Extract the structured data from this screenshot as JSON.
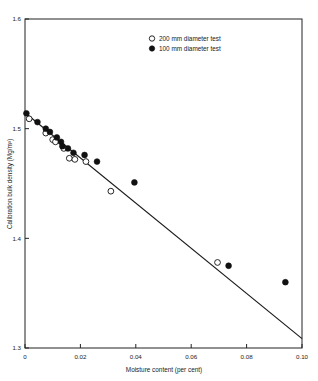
{
  "figure": {
    "caption_sliver": "",
    "background": "#ffffff",
    "ink_color": "#111111"
  },
  "legend": {
    "position": "top-center",
    "entries": [
      {
        "marker": "open-circle",
        "label": "200 mm diameter test"
      },
      {
        "marker": "filled-circle",
        "label": "100 mm diameter test"
      }
    ]
  },
  "axes": {
    "x": {
      "label": "Moisture content (per cent)",
      "ticks": [
        "0",
        "0.02",
        "0.04",
        "0.06",
        "0.08",
        "0.10"
      ],
      "tick_values": [
        0,
        0.02,
        0.04,
        0.06,
        0.08,
        0.1
      ],
      "min": 0,
      "max": 0.1
    },
    "y": {
      "label": "Calibration bulk density (Mg/m³)",
      "ticks": [
        "1.3",
        "1.4",
        "1.5",
        "1.6"
      ],
      "tick_values": [
        1.3,
        1.4,
        1.5,
        1.6
      ],
      "min": 1.3,
      "max": 1.6
    }
  },
  "chart_data": {
    "type": "scatter",
    "title": "",
    "xlabel": "Moisture content (per cent)",
    "ylabel": "Calibration bulk density (Mg/m³)",
    "xlim": [
      0,
      0.1
    ],
    "ylim": [
      1.3,
      1.6
    ],
    "xticks": [
      0,
      0.02,
      0.04,
      0.06,
      0.08,
      0.1
    ],
    "yticks": [
      1.3,
      1.4,
      1.5,
      1.6
    ],
    "grid": false,
    "legend_position": "top-center",
    "series": [
      {
        "name": "100 mm diameter test",
        "marker": "filled-circle",
        "points": [
          {
            "x": 0.0005,
            "y": 1.514
          },
          {
            "x": 0.0045,
            "y": 1.506
          },
          {
            "x": 0.0075,
            "y": 1.5
          },
          {
            "x": 0.009,
            "y": 1.497
          },
          {
            "x": 0.0115,
            "y": 1.492
          },
          {
            "x": 0.013,
            "y": 1.488
          },
          {
            "x": 0.0135,
            "y": 1.484
          },
          {
            "x": 0.0155,
            "y": 1.482
          },
          {
            "x": 0.0175,
            "y": 1.478
          },
          {
            "x": 0.0215,
            "y": 1.476
          },
          {
            "x": 0.026,
            "y": 1.47
          },
          {
            "x": 0.0395,
            "y": 1.451
          },
          {
            "x": 0.0735,
            "y": 1.375
          },
          {
            "x": 0.094,
            "y": 1.36
          }
        ]
      },
      {
        "name": "200 mm diameter test",
        "marker": "open-circle",
        "points": [
          {
            "x": 0.0015,
            "y": 1.509
          },
          {
            "x": 0.0075,
            "y": 1.496
          },
          {
            "x": 0.01,
            "y": 1.49
          },
          {
            "x": 0.011,
            "y": 1.488
          },
          {
            "x": 0.014,
            "y": 1.482
          },
          {
            "x": 0.016,
            "y": 1.473
          },
          {
            "x": 0.018,
            "y": 1.472
          },
          {
            "x": 0.022,
            "y": 1.47
          },
          {
            "x": 0.031,
            "y": 1.443
          },
          {
            "x": 0.0695,
            "y": 1.378
          }
        ]
      }
    ],
    "trendline": {
      "name": "best-fit line",
      "x_start": 0.0,
      "y_start": 1.5145,
      "x_end": 0.1,
      "y_end": 1.3085
    }
  }
}
